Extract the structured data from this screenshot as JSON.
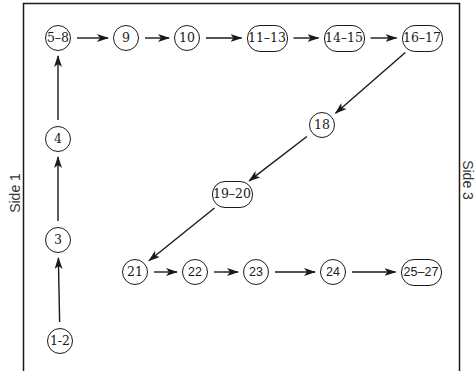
{
  "diagram": {
    "side_labels": {
      "left": "Side 1",
      "right": "Side 3"
    },
    "nodes": [
      {
        "id": "n1",
        "label": "1-2",
        "x": 60,
        "y": 341,
        "shape": "circle"
      },
      {
        "id": "n2",
        "label": "3",
        "x": 58,
        "y": 240,
        "shape": "circle"
      },
      {
        "id": "n3",
        "label": "4",
        "x": 58,
        "y": 139,
        "shape": "circle"
      },
      {
        "id": "n4",
        "label": "5–8",
        "x": 58,
        "y": 38,
        "shape": "circle"
      },
      {
        "id": "n5",
        "label": "9",
        "x": 126,
        "y": 38,
        "shape": "circle"
      },
      {
        "id": "n6",
        "label": "10",
        "x": 187,
        "y": 38,
        "shape": "circle"
      },
      {
        "id": "n7",
        "label": "11–13",
        "x": 267,
        "y": 38,
        "shape": "pill"
      },
      {
        "id": "n8",
        "label": "14–15",
        "x": 344,
        "y": 38,
        "shape": "pill"
      },
      {
        "id": "n9",
        "label": "16–17",
        "x": 422,
        "y": 38,
        "shape": "pill"
      },
      {
        "id": "n10",
        "label": "18",
        "x": 322,
        "y": 125,
        "shape": "circle"
      },
      {
        "id": "n11",
        "label": "19–20",
        "x": 232,
        "y": 194,
        "shape": "pill"
      },
      {
        "id": "n12",
        "label": "21",
        "x": 135,
        "y": 272,
        "shape": "circle"
      },
      {
        "id": "n13",
        "label": "22",
        "x": 195,
        "y": 272,
        "shape": "circle",
        "sans": true
      },
      {
        "id": "n14",
        "label": "23",
        "x": 256,
        "y": 272,
        "shape": "circle",
        "sans": true
      },
      {
        "id": "n15",
        "label": "24",
        "x": 333,
        "y": 272,
        "shape": "circle",
        "sans": true
      },
      {
        "id": "n16",
        "label": "25–27",
        "x": 421,
        "y": 272,
        "shape": "pill",
        "sans": true
      }
    ],
    "edges": [
      {
        "from": "n1",
        "to": "n2"
      },
      {
        "from": "n2",
        "to": "n3"
      },
      {
        "from": "n3",
        "to": "n4"
      },
      {
        "from": "n4",
        "to": "n5"
      },
      {
        "from": "n5",
        "to": "n6"
      },
      {
        "from": "n6",
        "to": "n7"
      },
      {
        "from": "n7",
        "to": "n8"
      },
      {
        "from": "n8",
        "to": "n9"
      },
      {
        "from": "n9",
        "to": "n10"
      },
      {
        "from": "n10",
        "to": "n11"
      },
      {
        "from": "n11",
        "to": "n12"
      },
      {
        "from": "n12",
        "to": "n13"
      },
      {
        "from": "n13",
        "to": "n14"
      },
      {
        "from": "n14",
        "to": "n15"
      },
      {
        "from": "n15",
        "to": "n16"
      }
    ],
    "colors": {
      "stroke": "#1a1a1a",
      "background": "#ffffff"
    }
  }
}
